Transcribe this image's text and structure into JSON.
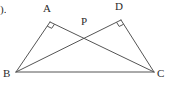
{
  "figure": {
    "kind": "geometry-diagram",
    "canvas": {
      "width": 172,
      "height": 87,
      "background": "#ffffff"
    },
    "stroke_color": "#555555",
    "label_color": "#2b2b2b",
    "corner_mark": {
      "text": ").",
      "x": 0,
      "y": 4
    },
    "points": [
      {
        "id": "A",
        "label": "A",
        "x": 50,
        "y": 22,
        "label_x": 43,
        "label_y": 3,
        "right_angle": true
      },
      {
        "id": "D",
        "label": "D",
        "x": 121,
        "y": 20,
        "label_x": 115,
        "label_y": 1,
        "right_angle": true
      },
      {
        "id": "P",
        "label": "P",
        "x": 88,
        "y": 32,
        "label_x": 81,
        "label_y": 16,
        "right_angle": false
      },
      {
        "id": "B",
        "label": "B",
        "x": 16,
        "y": 72,
        "label_x": 3,
        "label_y": 68,
        "right_angle": false
      },
      {
        "id": "C",
        "label": "C",
        "x": 154,
        "y": 72,
        "label_x": 157,
        "label_y": 68,
        "right_angle": false
      }
    ],
    "segments": [
      {
        "id": "BA",
        "from": "B",
        "to": "A"
      },
      {
        "id": "AC",
        "from": "A",
        "to": "C"
      },
      {
        "id": "BD",
        "from": "B",
        "to": "D"
      },
      {
        "id": "DC",
        "from": "D",
        "to": "C"
      },
      {
        "id": "BC",
        "from": "B",
        "to": "C"
      }
    ],
    "right_angle_marks": [
      {
        "at": "A",
        "size": 5
      },
      {
        "at": "D",
        "size": 5
      }
    ]
  }
}
